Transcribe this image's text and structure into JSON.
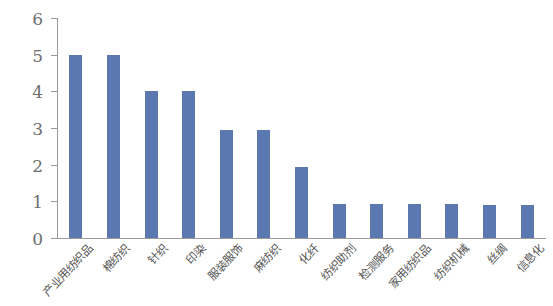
{
  "chart_data": {
    "type": "bar",
    "title": "",
    "subtitle": "",
    "xlabel": "",
    "ylabel": "",
    "ylim": [
      0,
      6
    ],
    "yticks": [
      0,
      1,
      2,
      3,
      4,
      5,
      6
    ],
    "grid": false,
    "legend": null,
    "series_color": "#5b79b0",
    "categories": [
      "产业用纺织品",
      "棉纺织",
      "针织",
      "印染",
      "服装服饰",
      "麻纺织",
      "化纤",
      "纺织助剂",
      "检测服务",
      "家用纺织品",
      "纺织机械",
      "丝绸",
      "信息化"
    ],
    "values": [
      5,
      5,
      4,
      4,
      2.95,
      2.95,
      1.95,
      0.92,
      0.92,
      0.92,
      0.92,
      0.9,
      0.9
    ]
  }
}
